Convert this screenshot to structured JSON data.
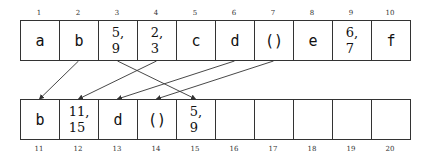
{
  "diagram": {
    "top_array": {
      "indices": [
        "1",
        "2",
        "3",
        "4",
        "5",
        "6",
        "7",
        "8",
        "9",
        "10"
      ],
      "cells": [
        {
          "value": "a",
          "type": "char"
        },
        {
          "value": "b",
          "type": "char"
        },
        {
          "value": "5,\n9",
          "type": "pointer"
        },
        {
          "value": "2,\n3",
          "type": "pointer"
        },
        {
          "value": "c",
          "type": "char"
        },
        {
          "value": "d",
          "type": "char"
        },
        {
          "value": "()",
          "type": "char"
        },
        {
          "value": "e",
          "type": "char"
        },
        {
          "value": "6,\n7",
          "type": "pointer"
        },
        {
          "value": "f",
          "type": "char"
        }
      ]
    },
    "bottom_array": {
      "indices": [
        "11",
        "12",
        "13",
        "14",
        "15",
        "16",
        "17",
        "18",
        "19",
        "20"
      ],
      "cells": [
        {
          "value": "b",
          "type": "char"
        },
        {
          "value": "11,\n15",
          "type": "pointer"
        },
        {
          "value": "d",
          "type": "char"
        },
        {
          "value": "()",
          "type": "char"
        },
        {
          "value": "5,\n9",
          "type": "pointer"
        },
        {
          "value": "",
          "type": "empty"
        },
        {
          "value": "",
          "type": "empty"
        },
        {
          "value": "",
          "type": "empty"
        },
        {
          "value": "",
          "type": "empty"
        },
        {
          "value": "",
          "type": "empty"
        }
      ]
    },
    "arrows": [
      {
        "from": "2",
        "to": "11"
      },
      {
        "from": "3",
        "to": "15"
      },
      {
        "from": "4",
        "to": "12"
      },
      {
        "from": "6",
        "to": "13"
      },
      {
        "from": "7",
        "to": "14"
      }
    ],
    "colors": {
      "line": "#333333",
      "text": "#111111",
      "background": "#ffffff"
    }
  }
}
